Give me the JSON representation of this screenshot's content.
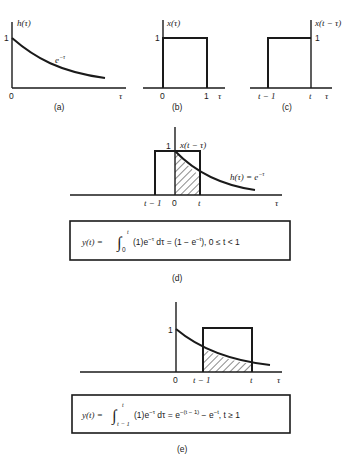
{
  "panels": {
    "a": {
      "caption": "(a)",
      "y_label": "h(τ)",
      "y_tick": "1",
      "x_origin": "0",
      "x_label": "τ",
      "curve_label": "e",
      "curve_label_exp": "−τ"
    },
    "b": {
      "caption": "(b)",
      "y_label": "x(τ)",
      "y_tick": "1",
      "x_origin": "0",
      "x_tick": "1",
      "x_label": "τ"
    },
    "c": {
      "caption": "(c)",
      "y_label": "x(t − τ)",
      "y_tick": "1",
      "x_tick_left": "t − 1",
      "x_tick_right": "t",
      "x_label": "τ"
    },
    "d": {
      "caption": "(d)",
      "y_tick": "1",
      "rect_label": "x(t − τ)",
      "curve_label": "h(τ) = e",
      "curve_label_exp": "−τ",
      "x_tick_left": "t − 1",
      "x_origin": "0",
      "x_tick_right": "t",
      "x_label": "τ",
      "equation": {
        "lhs": "y(t) =",
        "integral_upper": "t",
        "integral_lower": "0",
        "integrand": "(1)e",
        "integrand_exp": "−τ",
        "dtau": " dτ = (1 − e",
        "rhs_exp": "−t",
        "rhs_tail": "),   0 ≤ t < 1"
      }
    },
    "e": {
      "caption": "(e)",
      "y_tick": "1",
      "x_origin": "0",
      "x_tick_left": "t − 1",
      "x_tick_right": "t",
      "x_label": "τ",
      "equation": {
        "lhs": "y(t) =",
        "integral_upper": "t",
        "integral_lower": "t − 1",
        "integrand": "(1)e",
        "integrand_exp": "−τ",
        "dtau": " dτ = e",
        "rhs_exp1": "−(t − 1)",
        "rhs_mid": " − e",
        "rhs_exp2": "−t",
        "rhs_tail": ",   t ≥ 1"
      }
    }
  }
}
